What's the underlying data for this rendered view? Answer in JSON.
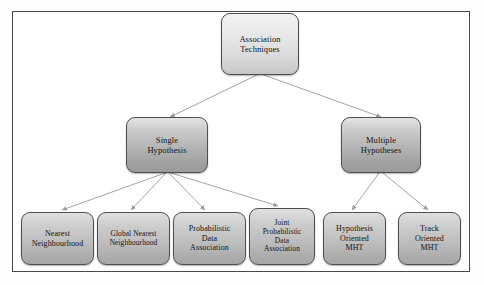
{
  "diagram": {
    "title_node": {
      "label": "Association\nTechniques"
    },
    "branches": [
      {
        "label": "Single\nHypothesis"
      },
      {
        "label": "Multiple\nHypotheses"
      }
    ],
    "leaves_single": [
      {
        "label": "Nearest\nNeighbourhood"
      },
      {
        "label": "Global Nearest\nNeighbourhood"
      },
      {
        "label": "Probabilistic\nData\nAssociation"
      },
      {
        "label": "Joint\nProbabilistic\nData\nAssociation"
      }
    ],
    "leaves_multiple": [
      {
        "label": "Hypothesis\nOriented\nMHT"
      },
      {
        "label": "Track\nOriented\nMHT"
      }
    ],
    "colors": {
      "frame_border": "#4a4a4a",
      "node_border": "#4f4f4f",
      "connector": "#9a9a9a",
      "text": "#121212",
      "background": "#ffffff"
    }
  }
}
